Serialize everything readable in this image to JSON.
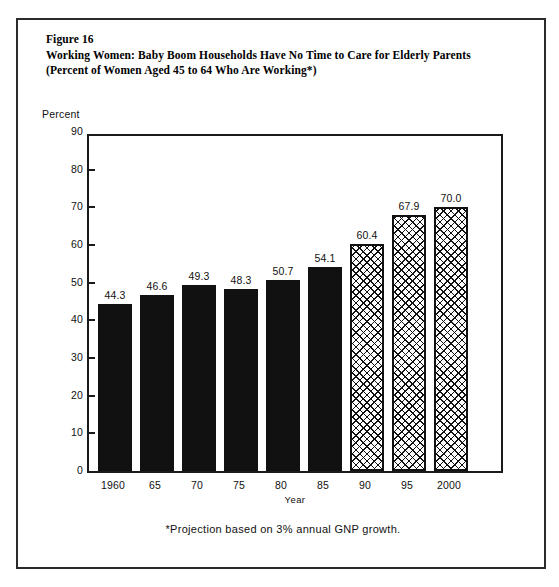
{
  "figure": {
    "number_label": "Figure 16",
    "title_line_1": "Working Women:  Baby Boom Households Have No Time to Care for Elderly Parents",
    "title_line_2": "(Percent of Women Aged 45 to 64 Who Are Working*)",
    "footnote": "*Projection based on 3% annual GNP growth."
  },
  "chart_data": {
    "type": "bar",
    "title": "Working Women:  Baby Boom Households Have No Time to Care for Elderly Parents",
    "subtitle": "(Percent of Women Aged 45 to 64 Who Are Working*)",
    "xlabel": "Year",
    "ylabel": "Percent",
    "ylim": [
      0,
      90
    ],
    "ytick_step": 10,
    "yticks": [
      0,
      10,
      20,
      30,
      40,
      50,
      60,
      70,
      80,
      90
    ],
    "ytick_labels": [
      "0",
      "10",
      "20",
      "30",
      "40",
      "50",
      "60",
      "70",
      "80",
      "90"
    ],
    "grid": false,
    "legend": "none",
    "categories": [
      "1960",
      "65",
      "70",
      "75",
      "80",
      "85",
      "90",
      "95",
      "2000"
    ],
    "values": [
      44.3,
      46.6,
      49.3,
      48.3,
      50.7,
      54.1,
      60.4,
      67.9,
      70.0
    ],
    "value_labels": [
      "44.3",
      "46.6",
      "49.3",
      "48.3",
      "50.7",
      "54.1",
      "60.4",
      "67.9",
      "70.0"
    ],
    "bar_styles": [
      "solid",
      "solid",
      "solid",
      "solid",
      "solid",
      "solid",
      "hatched",
      "hatched",
      "hatched"
    ],
    "colors": {
      "actual_bar": "#111111",
      "projected_bar_outline": "#111111",
      "projected_bar_fill": "#ffffff",
      "axis": "#1a1a1a",
      "text": "#111111",
      "background": "#ffffff",
      "page_border": "#2b2b2b"
    },
    "annotations": [
      "*Projection based on 3% annual GNP growth."
    ]
  }
}
